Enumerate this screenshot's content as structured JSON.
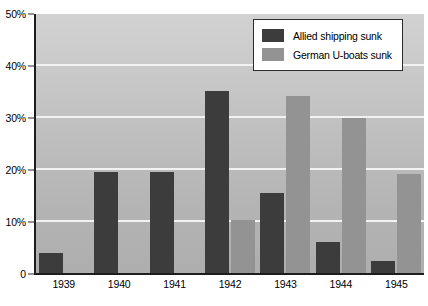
{
  "chart_data": {
    "type": "bar",
    "title": "",
    "xlabel": "",
    "ylabel": "",
    "categories": [
      "1939",
      "1940",
      "1941",
      "1942",
      "1943",
      "1944",
      "1945"
    ],
    "series": [
      {
        "name": "Allied shipping sunk",
        "color": "#3c3c3c",
        "values": [
          4,
          19.7,
          19.7,
          35.2,
          15.6,
          6.2,
          2.5
        ]
      },
      {
        "name": "German U-boats sunk",
        "color": "#939393",
        "values": [
          0,
          0,
          0,
          10.3,
          34.2,
          30,
          19.2
        ]
      }
    ],
    "ylim": [
      0,
      50
    ],
    "y_ticks": [
      0,
      10,
      20,
      30,
      40,
      50
    ],
    "y_tick_labels": [
      "0",
      "10%",
      "20%",
      "30%",
      "40%",
      "50%"
    ],
    "grid": true,
    "grid_color": "#f2f2f2",
    "legend_position": "top-right",
    "plot_background": "gray-vertical-gradient"
  },
  "legend": {
    "entries": [
      {
        "label": "Allied shipping sunk",
        "swatch": "series-allied"
      },
      {
        "label": "German U-boats sunk",
        "swatch": "series-uboat"
      }
    ]
  }
}
